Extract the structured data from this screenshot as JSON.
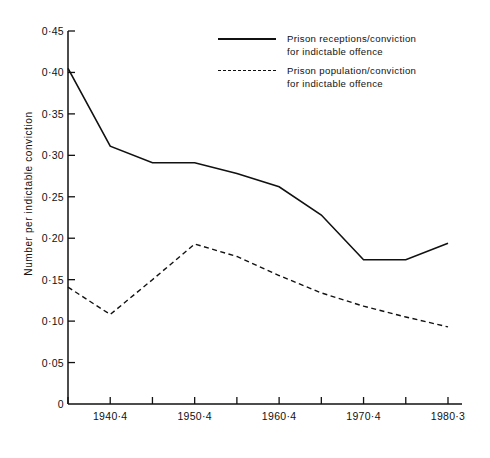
{
  "chart_data": {
    "type": "line",
    "title": "",
    "xlabel": "",
    "ylabel": "Number per indictable conviction",
    "ylim": [
      0,
      0.45
    ],
    "ytick_values": [
      0,
      0.05,
      0.1,
      0.15,
      0.2,
      0.25,
      0.3,
      0.35,
      0.4,
      0.45
    ],
    "ytick_labels": [
      "0",
      "0·05",
      "0·10",
      "0·15",
      "0·20",
      "0·25",
      "0·30",
      "0·35",
      "0·40",
      "0·45"
    ],
    "x_index": [
      0,
      1,
      2,
      3,
      4,
      5,
      6,
      7,
      8,
      9
    ],
    "xtick_labels": [
      "",
      "1940·4",
      "",
      "1950·4",
      "",
      "1960·4",
      "",
      "1970·4",
      "",
      "1980·3"
    ],
    "grid": false,
    "legend_position": "top-right",
    "series": [
      {
        "name": "Prison receptions/conviction for indictable offence",
        "style": "solid",
        "color": "#111111",
        "values": [
          0.405,
          0.311,
          0.291,
          0.291,
          0.278,
          0.262,
          0.228,
          0.174,
          0.174,
          0.194
        ]
      },
      {
        "name": "Prison population/conviction for indictable offence",
        "style": "dashed",
        "color": "#111111",
        "values": [
          0.141,
          0.108,
          0.15,
          0.193,
          0.178,
          0.155,
          0.134,
          0.118,
          0.105,
          0.093
        ]
      }
    ]
  },
  "legend": {
    "entries": [
      {
        "sample": "solid-line-sample",
        "line1": "Prison receptions/conviction",
        "line2": "for indictable offence"
      },
      {
        "sample": "dashed-line-sample",
        "line1": "Prison population/conviction",
        "line2": "for indictable offence"
      }
    ]
  },
  "axes": {
    "y_axis_label": "Number per indictable conviction"
  }
}
